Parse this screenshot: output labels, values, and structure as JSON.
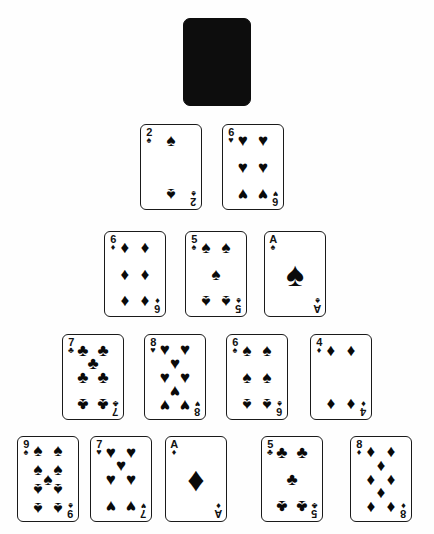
{
  "scene": {
    "title": "Pyramid solitaire card layout",
    "background_color": "#ffffff",
    "ink_color": "#0a0a0a",
    "card_back_color": "#0d0d0d"
  },
  "suit_glyphs": {
    "spade": "♠",
    "heart": "♥",
    "club": "♣",
    "diamond": "♦"
  },
  "rows": [
    {
      "row_index": 0,
      "cards": [
        {
          "face_down": true,
          "rank": "",
          "suit": "",
          "label": "face-down-card",
          "x": 183,
          "y": 18
        }
      ]
    },
    {
      "row_index": 1,
      "cards": [
        {
          "face_down": false,
          "rank": "2",
          "suit": "spade",
          "label": "2 of Spades",
          "x": 140,
          "y": 124
        },
        {
          "face_down": false,
          "rank": "6",
          "suit": "heart",
          "label": "6 of Hearts",
          "x": 222,
          "y": 124
        }
      ]
    },
    {
      "row_index": 2,
      "cards": [
        {
          "face_down": false,
          "rank": "6",
          "suit": "diamond",
          "label": "6 of Diamonds",
          "x": 104,
          "y": 231
        },
        {
          "face_down": false,
          "rank": "5",
          "suit": "spade",
          "label": "5 of Spades",
          "x": 185,
          "y": 231
        },
        {
          "face_down": false,
          "rank": "A",
          "suit": "spade",
          "label": "Ace of Spades",
          "x": 264,
          "y": 231
        }
      ]
    },
    {
      "row_index": 3,
      "cards": [
        {
          "face_down": false,
          "rank": "7",
          "suit": "club",
          "label": "7 of Clubs",
          "x": 62,
          "y": 334
        },
        {
          "face_down": false,
          "rank": "8",
          "suit": "heart",
          "label": "8 of Hearts",
          "x": 144,
          "y": 334
        },
        {
          "face_down": false,
          "rank": "6",
          "suit": "spade",
          "label": "6 of Spades",
          "x": 226,
          "y": 334
        },
        {
          "face_down": false,
          "rank": "4",
          "suit": "diamond",
          "label": "4 of Diamonds",
          "x": 310,
          "y": 334
        }
      ]
    },
    {
      "row_index": 4,
      "cards": [
        {
          "face_down": false,
          "rank": "9",
          "suit": "spade",
          "label": "9 of Spades",
          "x": 17,
          "y": 436
        },
        {
          "face_down": false,
          "rank": "7",
          "suit": "heart",
          "label": "7 of Hearts",
          "x": 90,
          "y": 436
        },
        {
          "face_down": false,
          "rank": "A",
          "suit": "diamond",
          "label": "Ace of Diamonds",
          "x": 165,
          "y": 436
        },
        {
          "face_down": false,
          "rank": "5",
          "suit": "club",
          "label": "5 of Clubs",
          "x": 261,
          "y": 436
        },
        {
          "face_down": false,
          "rank": "8",
          "suit": "diamond",
          "label": "8 of Diamonds",
          "x": 350,
          "y": 436
        }
      ]
    }
  ],
  "pip_layouts": {
    "A": [
      {
        "x": 50,
        "y": 50,
        "size": "big",
        "flip": false
      }
    ],
    "2": [
      {
        "x": 50,
        "y": 13,
        "size": "mid",
        "flip": false
      },
      {
        "x": 50,
        "y": 87,
        "size": "mid",
        "flip": true
      }
    ],
    "4": [
      {
        "x": 22,
        "y": 13,
        "size": "mid",
        "flip": false
      },
      {
        "x": 78,
        "y": 13,
        "size": "mid",
        "flip": false
      },
      {
        "x": 22,
        "y": 87,
        "size": "mid",
        "flip": true
      },
      {
        "x": 78,
        "y": 87,
        "size": "mid",
        "flip": true
      }
    ],
    "5": [
      {
        "x": 22,
        "y": 13,
        "size": "mid",
        "flip": false
      },
      {
        "x": 78,
        "y": 13,
        "size": "mid",
        "flip": false
      },
      {
        "x": 50,
        "y": 50,
        "size": "mid",
        "flip": false
      },
      {
        "x": 22,
        "y": 87,
        "size": "mid",
        "flip": true
      },
      {
        "x": 78,
        "y": 87,
        "size": "mid",
        "flip": true
      }
    ],
    "6": [
      {
        "x": 22,
        "y": 13,
        "size": "mid",
        "flip": false
      },
      {
        "x": 78,
        "y": 13,
        "size": "mid",
        "flip": false
      },
      {
        "x": 22,
        "y": 50,
        "size": "mid",
        "flip": false
      },
      {
        "x": 78,
        "y": 50,
        "size": "mid",
        "flip": false
      },
      {
        "x": 22,
        "y": 87,
        "size": "mid",
        "flip": true
      },
      {
        "x": 78,
        "y": 87,
        "size": "mid",
        "flip": true
      }
    ],
    "7": [
      {
        "x": 22,
        "y": 13,
        "size": "mid",
        "flip": false
      },
      {
        "x": 78,
        "y": 13,
        "size": "mid",
        "flip": false
      },
      {
        "x": 50,
        "y": 31,
        "size": "mid",
        "flip": false
      },
      {
        "x": 22,
        "y": 50,
        "size": "mid",
        "flip": false
      },
      {
        "x": 78,
        "y": 50,
        "size": "mid",
        "flip": false
      },
      {
        "x": 22,
        "y": 87,
        "size": "mid",
        "flip": true
      },
      {
        "x": 78,
        "y": 87,
        "size": "mid",
        "flip": true
      }
    ],
    "8": [
      {
        "x": 22,
        "y": 12,
        "size": "mid",
        "flip": false
      },
      {
        "x": 78,
        "y": 12,
        "size": "mid",
        "flip": false
      },
      {
        "x": 50,
        "y": 31,
        "size": "mid",
        "flip": false
      },
      {
        "x": 22,
        "y": 50,
        "size": "mid",
        "flip": false
      },
      {
        "x": 78,
        "y": 50,
        "size": "mid",
        "flip": false
      },
      {
        "x": 50,
        "y": 69,
        "size": "mid",
        "flip": true
      },
      {
        "x": 22,
        "y": 88,
        "size": "mid",
        "flip": true
      },
      {
        "x": 78,
        "y": 88,
        "size": "mid",
        "flip": true
      }
    ],
    "8d": [
      {
        "x": 22,
        "y": 12,
        "size": "mid",
        "flip": false
      },
      {
        "x": 78,
        "y": 12,
        "size": "mid",
        "flip": false
      },
      {
        "x": 50,
        "y": 31,
        "size": "mid",
        "flip": false
      },
      {
        "x": 22,
        "y": 50,
        "size": "mid",
        "flip": false
      },
      {
        "x": 78,
        "y": 50,
        "size": "mid",
        "flip": false
      },
      {
        "x": 50,
        "y": 69,
        "size": "mid",
        "flip": true
      },
      {
        "x": 22,
        "y": 88,
        "size": "mid",
        "flip": true
      },
      {
        "x": 78,
        "y": 88,
        "size": "mid",
        "flip": true
      }
    ],
    "9": [
      {
        "x": 22,
        "y": 11,
        "size": "mid",
        "flip": false
      },
      {
        "x": 78,
        "y": 11,
        "size": "mid",
        "flip": false
      },
      {
        "x": 22,
        "y": 36,
        "size": "mid",
        "flip": false
      },
      {
        "x": 78,
        "y": 36,
        "size": "mid",
        "flip": false
      },
      {
        "x": 50,
        "y": 50,
        "size": "mid",
        "flip": false
      },
      {
        "x": 22,
        "y": 64,
        "size": "mid",
        "flip": true
      },
      {
        "x": 78,
        "y": 64,
        "size": "mid",
        "flip": true
      },
      {
        "x": 22,
        "y": 89,
        "size": "mid",
        "flip": true
      },
      {
        "x": 78,
        "y": 89,
        "size": "mid",
        "flip": true
      }
    ]
  }
}
